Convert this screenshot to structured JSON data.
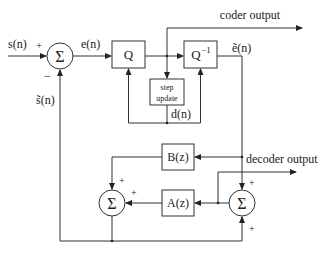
{
  "diagram": {
    "signals": {
      "input": "s(n)",
      "error": "e(n)",
      "quantized_error": "ẽ(n)",
      "estimate": "s̃(n)",
      "step": "d(n)",
      "coder_output": "coder output",
      "decoder_output": "decoder output"
    },
    "blocks": {
      "quantizer": "Q",
      "inverse_quantizer": "Q",
      "inverse_quantizer_sup": "−1",
      "step_update_line1": "step",
      "step_update_line2": "update",
      "b_filter": "B(z)",
      "a_filter": "A(z)",
      "sum_symbol": "Σ"
    },
    "signs": {
      "plus": "+",
      "minus": "−"
    }
  }
}
